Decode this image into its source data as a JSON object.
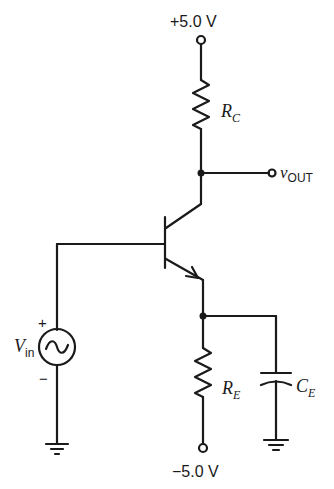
{
  "circuit": {
    "title": "Common-emitter amplifier with emitter bypass capacitor",
    "supply_positive": {
      "label": "+5.0 V"
    },
    "supply_negative": {
      "label": "−5.0 V"
    },
    "collector_resistor": {
      "symbol": "R",
      "subscript": "C"
    },
    "emitter_resistor": {
      "symbol": "R",
      "subscript": "E"
    },
    "emitter_capacitor": {
      "symbol": "C",
      "subscript": "E"
    },
    "output": {
      "symbol": "v",
      "subscript": "OUT"
    },
    "input_source": {
      "symbol": "V",
      "subscript": "in",
      "plus": "+",
      "minus": "−"
    },
    "transistor": {
      "type": "NPN BJT"
    }
  }
}
